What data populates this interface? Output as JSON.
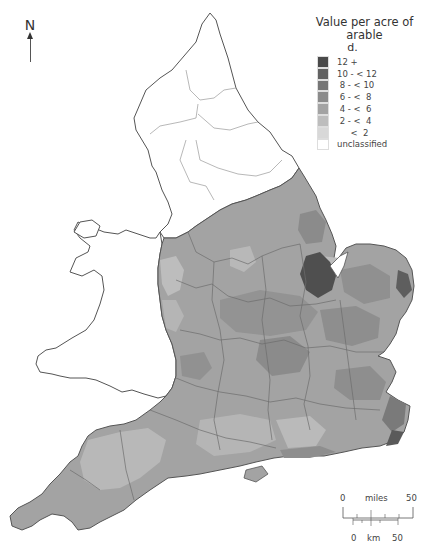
{
  "north_arrow": {
    "label": "N"
  },
  "legend": {
    "title": "Value per acre of arable",
    "unit": "d.",
    "classes": [
      {
        "label": "12 +",
        "color": "#4a4a4a"
      },
      {
        "label": "10 - < 12",
        "color": "#626262"
      },
      {
        "label": " 8 - < 10",
        "color": "#767676"
      },
      {
        "label": " 6 - <  8",
        "color": "#8b8b8b"
      },
      {
        "label": " 4 - <  6",
        "color": "#a3a3a3"
      },
      {
        "label": " 2 - <  4",
        "color": "#bdbdbd"
      },
      {
        "label": "     <  2",
        "color": "#d8d8d8"
      },
      {
        "label": "unclassified",
        "color": "#ffffff"
      }
    ]
  },
  "scale_bar": {
    "miles_start": "0",
    "miles_label": "miles",
    "miles_end": "50",
    "km_start": "0",
    "km_label": "km",
    "km_end": "50"
  },
  "map": {
    "background_color": "#ffffff",
    "boundary_color": "#555555",
    "county_line_color": "#777777",
    "unclassified_regions": [
      "Northern England",
      "Wales"
    ],
    "darkest_area": "The Fens / The Wash (Lincolnshire)"
  }
}
